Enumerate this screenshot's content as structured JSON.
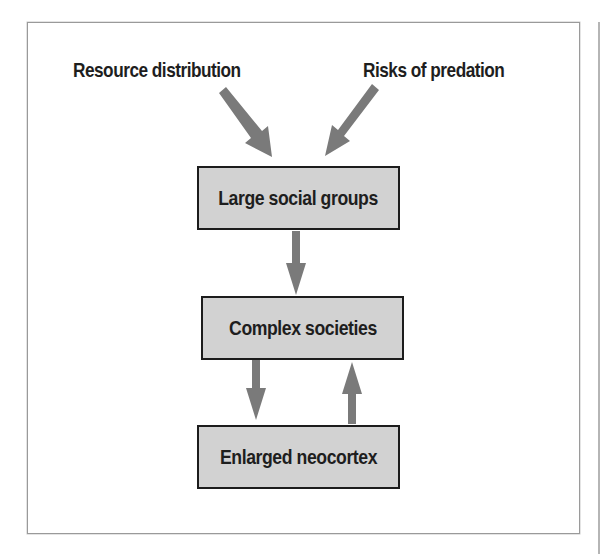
{
  "diagram": {
    "type": "flowchart",
    "inputs": [
      {
        "id": "resource",
        "label": "Resource distribution"
      },
      {
        "id": "predation",
        "label": "Risks of predation"
      }
    ],
    "nodes": [
      {
        "id": "groups",
        "label": "Large social groups"
      },
      {
        "id": "societies",
        "label": "Complex societies"
      },
      {
        "id": "neocortex",
        "label": "Enlarged neocortex"
      }
    ],
    "edges": [
      {
        "from": "resource",
        "to": "groups"
      },
      {
        "from": "predation",
        "to": "groups"
      },
      {
        "from": "groups",
        "to": "societies"
      },
      {
        "from": "societies",
        "to": "neocortex"
      },
      {
        "from": "neocortex",
        "to": "societies"
      }
    ],
    "colors": {
      "box_fill": "#d2d2d2",
      "box_border": "#1c1c1c",
      "arrow": "#7a7a7a",
      "text": "#1e1e1e",
      "frame": "#9a9a9a"
    }
  }
}
